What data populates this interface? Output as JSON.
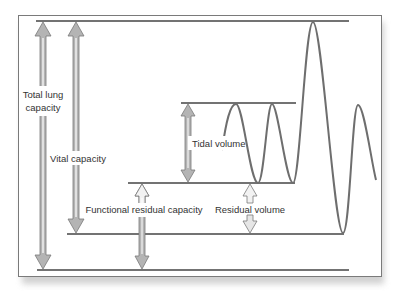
{
  "diagram": {
    "labels": {
      "total_lung_capacity_line1": "Total lung",
      "total_lung_capacity_line2": "capacity",
      "vital_capacity": "Vital capacity",
      "tidal_volume": "Tidal volume",
      "functional_residual_capacity": "Functional residual capacity",
      "residual_volume": "Residual volume"
    },
    "colors": {
      "frame": "#7a7a7a",
      "level_line": "#444444",
      "trace": "#6e6e6e",
      "arrow_fill": "#b4b4b4",
      "arrow_outline": "#7a7a7a",
      "arrow_hollow_fill": "#f2f2f2",
      "text": "#333333",
      "background": "#ffffff"
    },
    "levels": [
      {
        "name": "total-lung-capacity-level",
        "y": 21
      },
      {
        "name": "tidal-inspiration-level",
        "y": 103
      },
      {
        "name": "functional-residual-capacity-level",
        "y": 183
      },
      {
        "name": "residual-volume-level",
        "y": 234
      },
      {
        "name": "zero-volume-level",
        "y": 270
      }
    ]
  }
}
